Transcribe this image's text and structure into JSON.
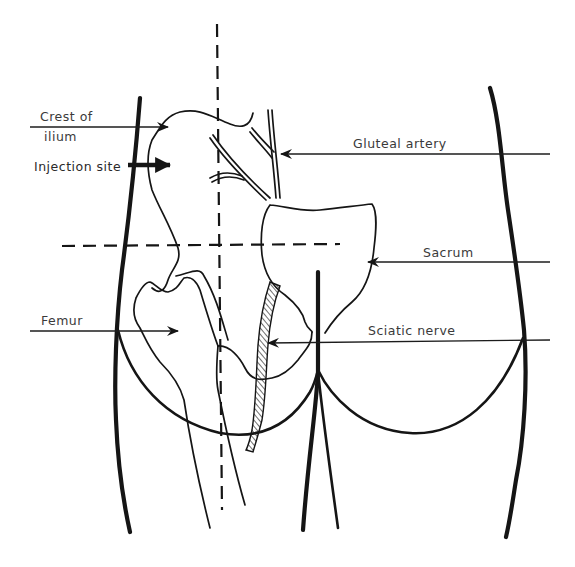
{
  "figure": {
    "colors": {
      "ink": "#151515",
      "label_text": "#3a3a3a",
      "background": "#ffffff"
    }
  },
  "labels": {
    "crest_of_ilium_line1": "Crest of",
    "crest_of_ilium_line2": "ilium",
    "injection_site": "Injection site",
    "gluteal_artery": "Gluteal artery",
    "sacrum": "Sacrum",
    "femur": "Femur",
    "sciatic_nerve": "Sciatic nerve"
  },
  "guides": {
    "vertical_dashed_line": "quadrant divider (vertical)",
    "horizontal_dashed_line": "quadrant divider (horizontal)"
  }
}
